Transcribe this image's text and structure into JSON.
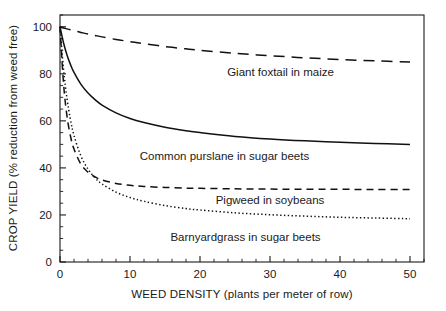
{
  "chart_data": {
    "type": "line",
    "title": "",
    "xlabel": "WEED DENSITY (plants per meter of row)",
    "ylabel": "CROP YIELD (% reduction from weed free)",
    "xlim": [
      0,
      52
    ],
    "ylim": [
      0,
      105
    ],
    "xticks": [
      0,
      10,
      20,
      30,
      40,
      50
    ],
    "xticklabels": [
      "0",
      "10",
      "20",
      "30",
      "40",
      "50"
    ],
    "yticks": [
      0,
      20,
      40,
      60,
      80,
      100
    ],
    "yticklabels": [
      "0",
      "20",
      "40",
      "60",
      "80",
      "100"
    ],
    "x_minor_tick_interval": 2,
    "y_minor_tick_interval": 5,
    "grid": false,
    "legend_position": "inline-labels-right",
    "frame": "full-box",
    "x": [
      0,
      0.5,
      1,
      1.5,
      2,
      3,
      4,
      5,
      6,
      8,
      10,
      12,
      15,
      18,
      20,
      25,
      30,
      35,
      40,
      45,
      50
    ],
    "series": [
      {
        "name": "Giant foxtail in maize",
        "label": "Giant foxtail in maize",
        "linestyle": "long-dash",
        "values": [
          100,
          99.5,
          99.1,
          98.7,
          98.3,
          97.6,
          96.9,
          96.3,
          95.7,
          94.6,
          93.7,
          92.8,
          91.6,
          90.6,
          90.0,
          88.7,
          87.7,
          86.8,
          86.1,
          85.5,
          85.0
        ],
        "label_position": {
          "x": 31.5,
          "y": 79
        }
      },
      {
        "name": "Common purslane in sugar beets",
        "label": "Common purslane in sugar beets",
        "linestyle": "solid",
        "values": [
          100,
          93.2,
          88.0,
          83.9,
          80.6,
          75.5,
          71.8,
          69.0,
          66.7,
          63.4,
          61.0,
          59.3,
          57.3,
          55.8,
          55.0,
          53.4,
          52.3,
          51.5,
          50.9,
          50.4,
          50.0
        ],
        "label_position": {
          "x": 23.5,
          "y": 43.5
        }
      },
      {
        "name": "Pigweed in soybeans",
        "label": "Pigweed in soybeans",
        "linestyle": "medium-dash",
        "values": [
          100,
          76.0,
          62.0,
          53.5,
          48.0,
          41.5,
          38.2,
          36.2,
          34.9,
          33.4,
          32.6,
          32.1,
          31.7,
          31.4,
          31.3,
          31.1,
          31.0,
          30.9,
          30.9,
          30.8,
          30.8
        ],
        "label_position": {
          "x": 30.0,
          "y": 24.5
        }
      },
      {
        "name": "Barnyardgrass in sugar beets",
        "label": "Barnyardgrass in sugar beets",
        "linestyle": "dotted",
        "values": [
          100,
          82.0,
          69.5,
          60.5,
          53.8,
          45.0,
          39.5,
          35.8,
          33.2,
          29.7,
          27.4,
          25.8,
          24.0,
          22.7,
          22.1,
          20.9,
          20.1,
          19.5,
          19.0,
          18.7,
          18.4
        ],
        "label_position": {
          "x": 26.5,
          "y": 9.0
        }
      }
    ]
  },
  "colors": {
    "ink": "#1a1a1a",
    "curve": "#111111",
    "background": "#ffffff"
  }
}
